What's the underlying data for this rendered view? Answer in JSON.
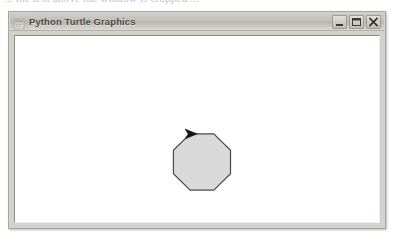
{
  "page": {
    "caption": "... the text above the window is cropped ..."
  },
  "window": {
    "title": "Python Turtle Graphics",
    "icon": "turtle-window-icon",
    "buttons": [
      {
        "name": "minimize",
        "label": "Minimize",
        "glyph": "minimize-icon"
      },
      {
        "name": "maximize",
        "label": "Maximize",
        "glyph": "maximize-icon"
      },
      {
        "name": "close",
        "label": "Close",
        "glyph": "close-icon"
      }
    ],
    "colors": {
      "titlebar_top": "#cfcdc8",
      "titlebar_bottom": "#dedcd7",
      "frame": "#d4d2cd",
      "canvas_background": "#ffffff",
      "border": "#a9a6a1"
    }
  },
  "drawing": {
    "description": "Octagon drawn with Python turtle graphics",
    "shape": "octagon",
    "sides": 8,
    "fill_color": "#d9d9d9",
    "pen_color": "#404040",
    "pen_width": 1,
    "center": {
      "x": 201,
      "y": 162
    },
    "radius": 31,
    "turtle": {
      "shape": "arrow",
      "color": "#1a1a1a",
      "position": {
        "x": 195,
        "y": 133
      },
      "heading": 0
    }
  }
}
